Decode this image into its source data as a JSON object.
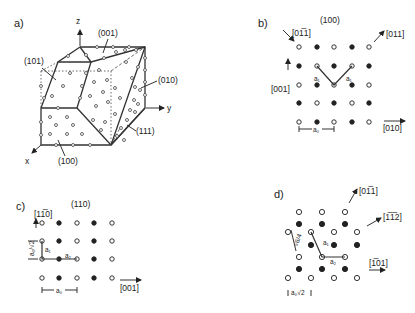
{
  "figure": {
    "panel_a": {
      "label": "a)",
      "axes": {
        "x": "x",
        "y": "y",
        "z": "z"
      },
      "faces": [
        "(001)",
        "(101)",
        "(010)",
        "(111)",
        "(100)"
      ]
    },
    "panel_b": {
      "label": "b)",
      "plane": "(100)",
      "directions": {
        "up_left": "[01̅1]",
        "up_right": "[011]",
        "vertical": "[001]",
        "horizontal": "[010]"
      },
      "vector_labels": [
        "a₁",
        "a₁"
      ],
      "lattice_constant": "a₀",
      "lattice": [
        [
          "open",
          "filled",
          "open",
          "filled",
          "open"
        ],
        [
          "filled",
          "open",
          "filled",
          "open",
          "filled"
        ],
        [
          "open",
          "filled",
          "open",
          "filled",
          "open"
        ],
        [
          "filled",
          "open",
          "filled",
          "open",
          "filled"
        ],
        [
          "open",
          "filled",
          "open",
          "filled",
          "open"
        ]
      ]
    },
    "panel_c": {
      "label": "c)",
      "plane": "(110)",
      "directions": {
        "vertical": "[11̅0]",
        "horizontal": "[001]"
      },
      "vector_labels": [
        "a₁",
        "a₂"
      ],
      "lattice_constant": "a₀",
      "vertical_spacing": "a₀/√2",
      "lattice": [
        [
          "open",
          "filled",
          "open",
          "filled",
          "open"
        ],
        [
          "open",
          "filled",
          "open",
          "filled",
          "open"
        ],
        [
          "open",
          "filled",
          "open",
          "filled",
          "open"
        ],
        [
          "open",
          "filled",
          "open",
          "filled",
          "open"
        ]
      ]
    },
    "panel_d": {
      "label": "d)",
      "directions": {
        "up": "[01̅1]",
        "diag": "[1̅1̅2]",
        "horizontal": "[1̅01]"
      },
      "vector_labels": [
        "a₁",
        "a₂"
      ],
      "spacing_label": "√6/4",
      "lattice_constant": "a₀√2"
    }
  }
}
